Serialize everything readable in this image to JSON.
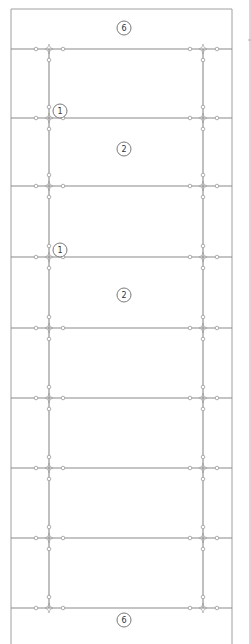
{
  "diagram": {
    "type": "floor-joist-framing-plan",
    "colors": {
      "line": "#8a8a8a",
      "frame": "#a0a0a0",
      "node": "#9a9a9a",
      "label_text": "#333333"
    },
    "frame": {
      "left": 11,
      "right": 232,
      "top": 9,
      "bottom": 644
    },
    "neighbor_panel_edge_x": 250,
    "horizontal_lines_y": [
      49,
      118,
      186,
      257,
      328,
      398,
      468,
      538,
      608
    ],
    "vertical_lines_x": [
      49,
      203
    ],
    "labels": [
      {
        "id": "label-top-6",
        "text": "6",
        "x": 124,
        "y": 28
      },
      {
        "id": "label-1a",
        "text": "1",
        "x": 60,
        "y": 111
      },
      {
        "id": "label-2a",
        "text": "2",
        "x": 124,
        "y": 149
      },
      {
        "id": "label-1b",
        "text": "1",
        "x": 60,
        "y": 250
      },
      {
        "id": "label-2b",
        "text": "2",
        "x": 124,
        "y": 295
      },
      {
        "id": "label-bottom-6",
        "text": "6",
        "x": 124,
        "y": 620
      }
    ]
  }
}
